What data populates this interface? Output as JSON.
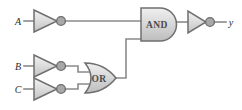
{
  "figure": {
    "kind": "logic-circuit-diagram",
    "width": 242,
    "height": 110,
    "background_color": "#ffffff"
  },
  "colors": {
    "wire": "#8a8a8a",
    "gate_outline": "#6f6f6f",
    "gate_fill_light": "#e8e8e8",
    "gate_fill_dark": "#c9c9c9",
    "bubble_fill": "#a8a8a8",
    "label_text": "#2b2b2b",
    "gate_text": "#4a4a4a"
  },
  "inputs": [
    {
      "id": "A",
      "label": "A",
      "x": 18,
      "y": 21
    },
    {
      "id": "B",
      "label": "B",
      "x": 18,
      "y": 66
    },
    {
      "id": "C",
      "label": "C",
      "x": 18,
      "y": 89
    }
  ],
  "outputs": [
    {
      "id": "y",
      "label": "y",
      "x": 230,
      "y": 22
    }
  ],
  "gates": [
    {
      "id": "inv-a",
      "type": "inverter",
      "label": "",
      "has_bubble": true,
      "x": 33,
      "y": 21,
      "w": 25,
      "h": 22
    },
    {
      "id": "inv-b",
      "type": "inverter",
      "label": "",
      "has_bubble": true,
      "x": 33,
      "y": 66,
      "w": 25,
      "h": 22
    },
    {
      "id": "inv-c",
      "type": "inverter",
      "label": "",
      "has_bubble": true,
      "x": 33,
      "y": 89,
      "w": 25,
      "h": 22
    },
    {
      "id": "or-gate",
      "type": "or",
      "label": "OR",
      "has_bubble": false,
      "x": 84,
      "y": 78,
      "w": 32,
      "h": 30
    },
    {
      "id": "and-gate",
      "type": "and",
      "label": "AND",
      "has_bubble": false,
      "x": 139,
      "y": 24,
      "w": 37,
      "h": 33
    },
    {
      "id": "inv-out",
      "type": "inverter",
      "label": "",
      "has_bubble": true,
      "x": 186,
      "y": 22,
      "w": 24,
      "h": 22
    }
  ],
  "wires": [
    {
      "id": "wire-a-in",
      "points": "24,21 33,21"
    },
    {
      "id": "wire-a-to-and",
      "points": "66,21 139,21"
    },
    {
      "id": "wire-b-in",
      "points": "24,66 33,66"
    },
    {
      "id": "wire-b-to-or",
      "points": "66,66 78,66 78,72 88,72"
    },
    {
      "id": "wire-c-in",
      "points": "24,89 33,89"
    },
    {
      "id": "wire-c-to-or",
      "points": "66,89 78,89 78,84 88,84"
    },
    {
      "id": "wire-or-to-and",
      "points": "116,78 126,78 126,39 139,39"
    },
    {
      "id": "wire-and-to-inv",
      "points": "176,22 186,22"
    },
    {
      "id": "wire-inv-to-y",
      "points": "215,22 226,22"
    }
  ],
  "logic": {
    "expression": "y = NOT( NOT(A) AND ( NOT(B) OR NOT(C) ) )",
    "gate_names": [
      "AND",
      "OR"
    ],
    "input_names": [
      "A",
      "B",
      "C"
    ],
    "output_names": [
      "y"
    ]
  }
}
